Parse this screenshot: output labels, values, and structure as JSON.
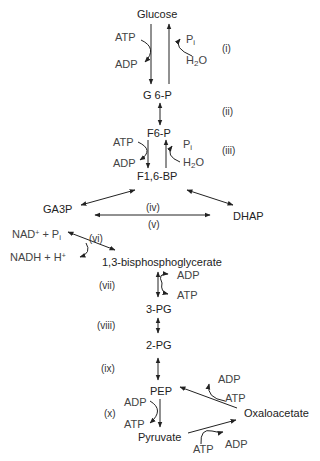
{
  "diagram": {
    "type": "biochemical-pathway",
    "nodes": {
      "glucose": "Glucose",
      "g6p": "G 6-P",
      "f6p": "F6-P",
      "f16bp": "F1,6-BP",
      "ga3p": "GA3P",
      "dhap": "DHAP",
      "bpg13": "1,3-bisphosphoglycerate",
      "pg3": "3-PG",
      "pg2": "2-PG",
      "pep": "PEP",
      "pyruvate": "Pyruvate",
      "oxaloacetate": "Oxaloacetate"
    },
    "cofactors": {
      "step1_atp": "ATP",
      "step1_adp": "ADP",
      "step1_pi": "P",
      "step1_pi_sub": "i",
      "step1_h2o": "H",
      "step1_h2o_sub": "2",
      "step1_h2o_end": "O",
      "step3_atp": "ATP",
      "step3_adp": "ADP",
      "step3_pi": "P",
      "step3_pi_sub": "i",
      "step3_h2o": "H",
      "step3_h2o_sub": "2",
      "step3_h2o_end": "O",
      "step6_nad": "NAD",
      "step6_nad_sup": "+",
      "step6_nad_rest": " + P",
      "step6_nad_sub": "i",
      "step6_nadh": "NADH + H",
      "step6_nadh_sup": "+",
      "step7_adp": "ADP",
      "step7_atp": "ATP",
      "step10_adp": "ADP",
      "step10_atp": "ATP",
      "pc_atp": "ATP",
      "pc_adp": "ADP",
      "pepck_adp": "ADP",
      "pepck_atp": "ATP"
    },
    "steps": [
      "(i)",
      "(ii)",
      "(iii)",
      "(iv)",
      "(v)",
      "(vi)",
      "(vii)",
      "(viii)",
      "(ix)",
      "(x)"
    ]
  }
}
